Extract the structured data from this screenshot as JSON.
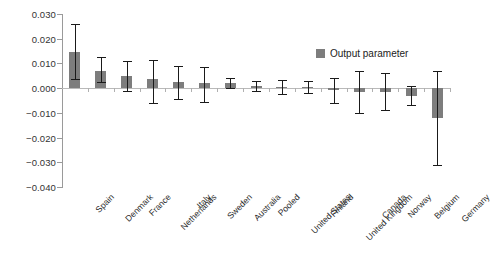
{
  "chart_data": {
    "type": "bar",
    "title": "",
    "xlabel": "",
    "ylabel": "",
    "ylim": [
      -0.04,
      0.03
    ],
    "grid": false,
    "legend_position": "top-right",
    "legend": [
      "Output parameter"
    ],
    "yticks": [
      "0.030",
      "0.020",
      "0.010",
      "0.000",
      "-0.010",
      "-0.020",
      "-0.030",
      "-0.040"
    ],
    "ytick_values": [
      0.03,
      0.02,
      0.01,
      0.0,
      -0.01,
      -0.02,
      -0.03,
      -0.04
    ],
    "categories": [
      "Spain",
      "Denmark",
      "France",
      "Netherlands",
      "Italy",
      "Sweden",
      "Australia",
      "Pooled",
      "United States",
      "Finland",
      "United Kingdom",
      "Canada",
      "Norway",
      "Belgium",
      "Germany"
    ],
    "series": [
      {
        "name": "Output parameter",
        "color": "#7d7d7d",
        "values": [
          0.0145,
          0.007,
          0.005,
          0.0035,
          0.0025,
          0.002,
          0.002,
          0.0008,
          0.0005,
          0.0005,
          -0.0008,
          -0.0015,
          -0.0015,
          -0.003,
          -0.012
        ],
        "error_upper": [
          0.026,
          0.0125,
          0.011,
          0.0115,
          0.009,
          0.0085,
          0.004,
          0.0028,
          0.0032,
          0.003,
          0.0042,
          0.007,
          0.006,
          0.001,
          0.007
        ],
        "error_lower": [
          0.0035,
          0.0025,
          -0.001,
          -0.006,
          -0.0045,
          -0.0055,
          0.0002,
          -0.0012,
          -0.0022,
          -0.002,
          -0.006,
          -0.01,
          -0.009,
          -0.007,
          -0.031
        ]
      }
    ]
  },
  "legend": {
    "label": "Output parameter"
  }
}
